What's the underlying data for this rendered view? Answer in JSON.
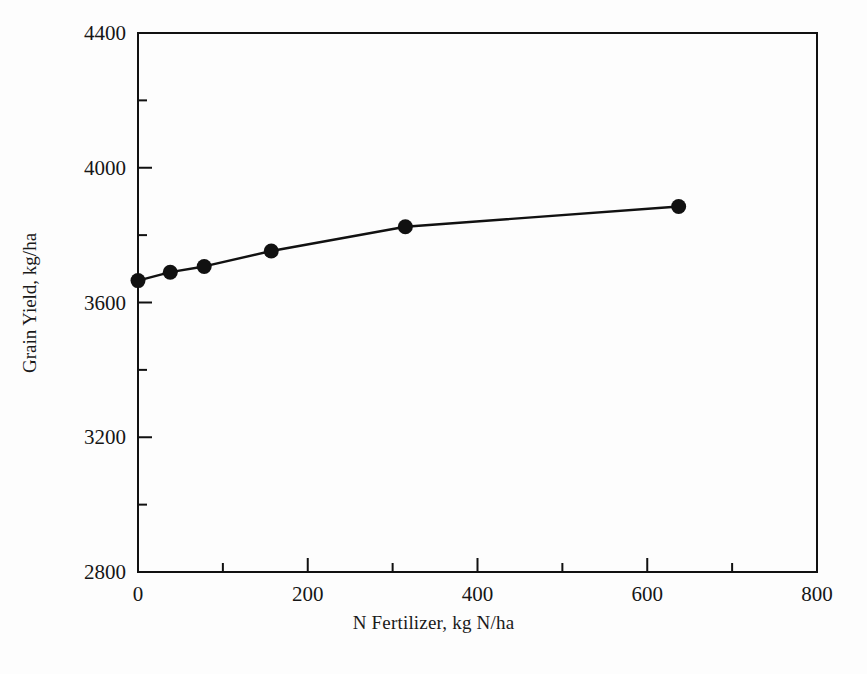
{
  "figure": {
    "background_color": "#fdfdfd",
    "ink_color": "#111111"
  },
  "chart_data": {
    "type": "line",
    "title": "",
    "xlabel": "N Fertilizer, kg N/ha",
    "ylabel": "Grain Yield, kg/ha",
    "xlim": [
      0,
      800
    ],
    "ylim": [
      2800,
      4400
    ],
    "xticks": [
      0,
      200,
      400,
      600,
      800
    ],
    "xtick_labels": [
      "0",
      "200",
      "400",
      "600",
      "800"
    ],
    "xminor_ticks": [
      100,
      300,
      500,
      700
    ],
    "yticks": [
      2800,
      3200,
      3600,
      4000,
      4400
    ],
    "ytick_labels": [
      "2800",
      "3200",
      "3600",
      "4000",
      "4400"
    ],
    "yminor_ticks": [
      3000,
      3400,
      3800,
      4200
    ],
    "grid": false,
    "legend": null,
    "series": [
      {
        "name": "Grain Yield",
        "marker": "filled-circle",
        "marker_size": 15,
        "line_color": "#111111",
        "marker_color": "#111111",
        "x": [
          0,
          38,
          78,
          157,
          315,
          637
        ],
        "y": [
          3665,
          3690,
          3707,
          3753,
          3825,
          3885
        ]
      }
    ]
  }
}
